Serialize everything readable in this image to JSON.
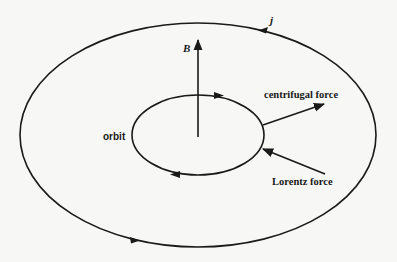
{
  "diagram": {
    "labels": {
      "current": "j",
      "magnetic_field": "B",
      "orbit": "orbit",
      "centrifugal_force": "centrifugal force",
      "lorentz_force": "Lorentz force"
    },
    "colors": {
      "line": "#1a1a1a",
      "background": "#f7f7f5"
    },
    "outer_loop": {
      "cx": 198,
      "cy": 135,
      "rx": 178,
      "ry": 112,
      "direction": "counterclockwise"
    },
    "orbit_loop": {
      "cx": 198,
      "cy": 135,
      "rx": 66,
      "ry": 40,
      "direction": "clockwise"
    }
  }
}
